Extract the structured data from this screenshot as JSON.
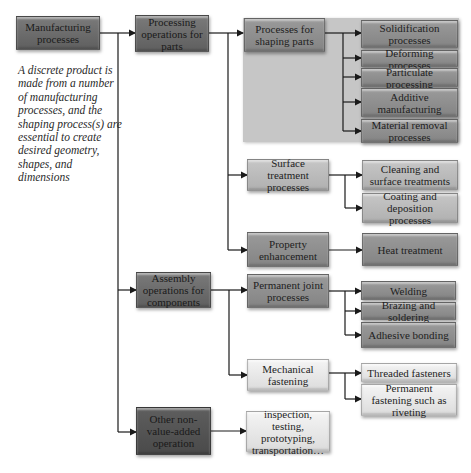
{
  "diagram": {
    "root": {
      "label": "Manufacturing processes"
    },
    "description": "A discrete product is made from a number of manufacturing processes, and the shaping process(s) are essential to create desired geometry, shapes, and dimensions",
    "level1": [
      {
        "label": "Processing operations for parts"
      },
      {
        "label": "Assembly operations for components"
      },
      {
        "label": "Other non-value-added operation"
      }
    ],
    "processing": {
      "shaping": {
        "label": "Processes for shaping parts",
        "children": [
          "Solidification processes",
          "Deforming processes",
          "Particulate processing",
          "Additive manufacturing",
          "Material removal processes"
        ]
      },
      "surface": {
        "label": "Surface treatment processes",
        "children": [
          "Cleaning and surface treatments",
          "Coating and deposition processes"
        ]
      },
      "property": {
        "label": "Property enhancement",
        "children": [
          "Heat treatment"
        ]
      }
    },
    "assembly": {
      "permanent": {
        "label": "Permanent joint processes",
        "children": [
          "Welding",
          "Brazing and soldering",
          "Adhesive bonding"
        ]
      },
      "mechanical": {
        "label": "Mechanical fastening",
        "children": [
          "Threaded fasteners",
          "Permanent fastening such as riveting"
        ]
      }
    },
    "other": {
      "children": [
        "inspection, testing, prototyping, transportation…"
      ]
    }
  },
  "colors": {
    "dark": "#6b6b6b",
    "mid": "#8f8f8f",
    "light": "#bcbcbc",
    "pale": "#e8e8e8",
    "panel": "#c6c6c6",
    "line": "#1a1a1a"
  }
}
